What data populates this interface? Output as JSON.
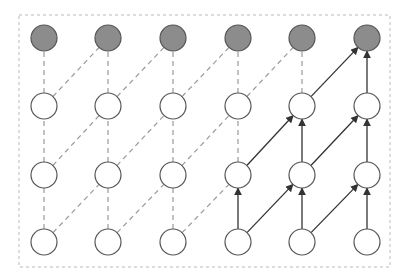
{
  "diagram": {
    "type": "dilated-causal-convolution-network",
    "frame": {
      "x": 19,
      "y": 15,
      "width": 371,
      "height": 252,
      "stroke": "#bbbbbb",
      "dash": "3,3"
    },
    "columns_x": [
      44,
      108,
      173,
      238,
      302,
      367
    ],
    "rows_y": [
      38,
      106,
      175,
      242
    ],
    "node_radius": 13,
    "colors": {
      "output_fill": "#8c8c8c",
      "hidden_fill": "#ffffff",
      "node_stroke": "#555555",
      "dashed_edge": "#9a9a9a",
      "solid_edge": "#333333"
    },
    "layers": [
      {
        "name": "output",
        "row": 0,
        "filled": true
      },
      {
        "name": "hidden-2",
        "row": 1,
        "filled": false
      },
      {
        "name": "hidden-1",
        "row": 2,
        "filled": false
      },
      {
        "name": "input",
        "row": 3,
        "filled": false
      }
    ],
    "active_paths": [
      {
        "from": [
          3,
          3
        ],
        "to": [
          2,
          4
        ]
      },
      {
        "from": [
          3,
          4
        ],
        "to": [
          2,
          4
        ]
      },
      {
        "from": [
          3,
          4
        ],
        "to": [
          2,
          5
        ]
      },
      {
        "from": [
          3,
          5
        ],
        "to": [
          2,
          5
        ]
      },
      {
        "from": [
          2,
          4
        ],
        "to": [
          1,
          5
        ]
      },
      {
        "from": [
          2,
          5
        ],
        "to": [
          1,
          5
        ]
      },
      {
        "from": [
          1,
          4
        ],
        "to": [
          0,
          5
        ]
      },
      {
        "from": [
          1,
          5
        ],
        "to": [
          0,
          5
        ]
      },
      {
        "from": [
          3,
          3
        ],
        "to": [
          2,
          3
        ]
      },
      {
        "from": [
          2,
          3
        ],
        "to": [
          1,
          4
        ]
      },
      {
        "from": [
          2,
          4
        ],
        "to": [
          1,
          4
        ]
      }
    ]
  }
}
